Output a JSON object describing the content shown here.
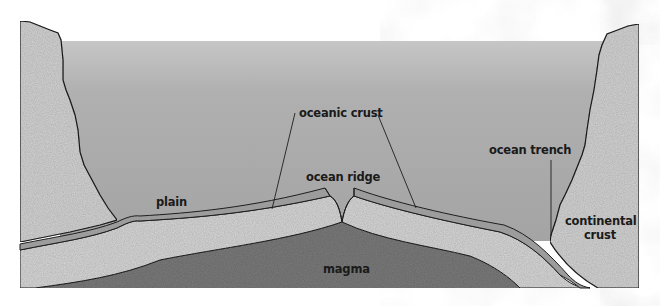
{
  "diagram": {
    "labels": {
      "oceanic_crust": "oceanic crust",
      "ocean_ridge": "ocean ridge",
      "plain": "plain",
      "ocean_trench": "ocean trench",
      "continental_crust_line1": "continental",
      "continental_crust_line2": "crust",
      "magma": "magma"
    },
    "colors": {
      "ocean_top": "#c4c4c4",
      "ocean_bottom": "#a3a3a3",
      "continental_crust": "#d3d3d3",
      "oceanic_crust": "#9c9c9c",
      "lithosphere": "#d6d6d6",
      "magma": "#7a7a7a",
      "outline": "#1e1e1e",
      "background_clouds": "#e6e6e6"
    }
  }
}
